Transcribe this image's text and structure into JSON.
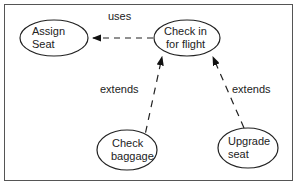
{
  "diagram": {
    "type": "use-case",
    "use_cases": [
      {
        "id": "assign_seat",
        "line1": "Assign",
        "line2": "Seat"
      },
      {
        "id": "check_in",
        "line1": "Check in",
        "line2": "for flight"
      },
      {
        "id": "check_baggage",
        "line1": "Check",
        "line2": "baggage"
      },
      {
        "id": "upgrade_seat",
        "line1": "Upgrade",
        "line2": "seat"
      }
    ],
    "relations": [
      {
        "from": "check_in",
        "to": "assign_seat",
        "label": "uses"
      },
      {
        "from": "check_baggage",
        "to": "check_in",
        "label": "extends"
      },
      {
        "from": "upgrade_seat",
        "to": "check_in",
        "label": "extends"
      }
    ]
  }
}
